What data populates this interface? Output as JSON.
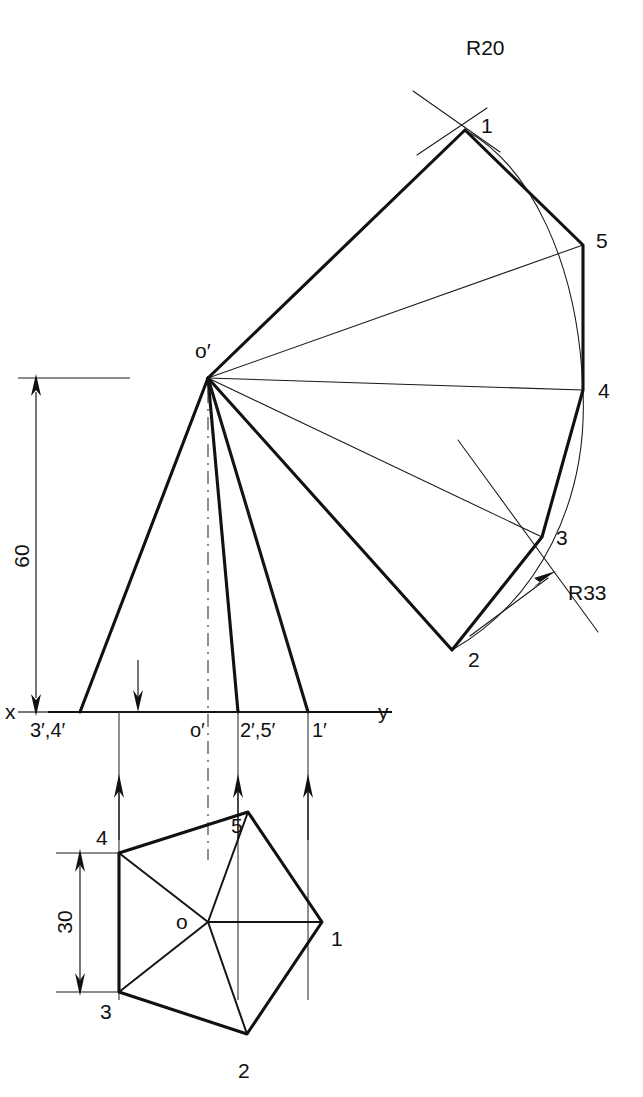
{
  "drawing": {
    "title": "Orthographic projection of a pentagonal pyramid with development arcs",
    "type": "engineering-drawing",
    "colors": {
      "line": "#111111",
      "thin_line": "#1a1a1a",
      "background": "#ffffff"
    },
    "axes": {
      "x_label": "x",
      "y_label": "y",
      "line_y": 712,
      "line_x_start": 48,
      "line_x_end": 400
    },
    "dimensions": [
      {
        "name": "height-dimension",
        "value": "60",
        "orientation": "vertical",
        "from_y": 378,
        "to_y": 712,
        "at_x": 36
      },
      {
        "name": "width-dimension",
        "value": "30",
        "orientation": "vertical",
        "from_y": 853,
        "to_y": 992,
        "at_x": 80
      }
    ],
    "radii": [
      {
        "name": "outer-radius",
        "label": "R20",
        "x": 470,
        "y": 47
      },
      {
        "name": "inner-radius",
        "label": "R33",
        "x": 575,
        "y": 600
      }
    ],
    "front_view": {
      "apex_label": "o′",
      "apex_x": 208,
      "apex_y": 378,
      "base_labels": [
        {
          "name": "base-point-34",
          "text": "3′,4′",
          "x": 36,
          "y": 737
        },
        {
          "name": "base-point-o",
          "text": "o′",
          "x": 196,
          "y": 737
        },
        {
          "name": "base-point-25",
          "text": "2′,5′",
          "x": 218,
          "y": 737
        },
        {
          "name": "base-point-1",
          "text": "1′",
          "x": 303,
          "y": 737
        }
      ]
    },
    "development": {
      "point_labels": [
        {
          "name": "dev-point-1",
          "text": "1",
          "x": 481,
          "y": 133
        },
        {
          "name": "dev-point-5",
          "text": "5",
          "x": 590,
          "y": 248
        },
        {
          "name": "dev-point-4",
          "text": "4",
          "x": 592,
          "y": 398
        },
        {
          "name": "dev-point-3",
          "text": "3",
          "x": 553,
          "y": 545
        },
        {
          "name": "dev-point-2",
          "text": "2",
          "x": 466,
          "y": 667
        }
      ]
    },
    "top_view": {
      "center_label": "o",
      "center_x": 208,
      "center_y": 922,
      "vertex_labels": [
        {
          "name": "top-vertex-1",
          "text": "1",
          "x": 331,
          "y": 946
        },
        {
          "name": "top-vertex-2",
          "text": "2",
          "x": 238,
          "y": 1078
        },
        {
          "name": "top-vertex-3",
          "text": "3",
          "x": 100,
          "y": 1019
        },
        {
          "name": "top-vertex-4",
          "text": "4",
          "x": 98,
          "y": 845
        },
        {
          "name": "top-vertex-5",
          "text": "5",
          "x": 233,
          "y": 833
        }
      ]
    }
  }
}
